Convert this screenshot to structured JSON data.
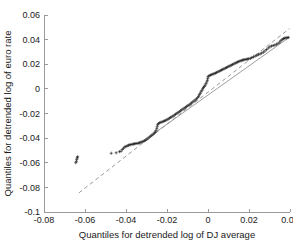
{
  "figure": {
    "name": "qq-plot",
    "background": "#ffffff",
    "axis_color": "#9a9a9a",
    "marker_color": "#111111",
    "reference_line_color": "#8d8d8d"
  },
  "chart_data": {
    "type": "scatter",
    "title": "",
    "subtitle": "",
    "xlabel": "Quantiles for detrended log of DJ average",
    "ylabel": "Quantiles for detrended log of euro rate",
    "xlim": [
      -0.08,
      0.04
    ],
    "ylim": [
      -0.1,
      0.06
    ],
    "xticks": [
      -0.08,
      -0.06,
      -0.04,
      -0.02,
      0,
      0.02,
      0.04
    ],
    "xticklabels": [
      "-0.08",
      "-0.06",
      "-0.04",
      "-0.02",
      "0",
      "0.02",
      "0.04"
    ],
    "yticks": [
      -0.1,
      -0.08,
      -0.06,
      -0.04,
      -0.02,
      0,
      0.02,
      0.04,
      0.06
    ],
    "yticklabels": [
      "-0.1",
      "-0.08",
      "-0.06",
      "-0.04",
      "-0.02",
      "0",
      "0.02",
      "0.04",
      "0.06"
    ],
    "grid": false,
    "legend": null,
    "legend_position": "none",
    "marker": "+",
    "annotations": [],
    "series": [
      {
        "name": "sample quantiles",
        "marker": "+",
        "color": "#111111",
        "points": [
          [
            -0.0645,
            -0.06
          ],
          [
            -0.0642,
            -0.0588
          ],
          [
            -0.064,
            -0.0572
          ],
          [
            -0.0638,
            -0.056
          ],
          [
            -0.0636,
            -0.0551
          ],
          [
            -0.0472,
            -0.0523
          ],
          [
            -0.0448,
            -0.0519
          ],
          [
            -0.0432,
            -0.051
          ],
          [
            -0.0424,
            -0.0506
          ],
          [
            -0.0418,
            -0.0492
          ],
          [
            -0.0412,
            -0.0482
          ],
          [
            -0.0406,
            -0.0472
          ],
          [
            -0.04,
            -0.0468
          ],
          [
            -0.0394,
            -0.0462
          ],
          [
            -0.0388,
            -0.0458
          ],
          [
            -0.0382,
            -0.0455
          ],
          [
            -0.0376,
            -0.0452
          ],
          [
            -0.037,
            -0.045
          ],
          [
            -0.0364,
            -0.0448
          ],
          [
            -0.0358,
            -0.0446
          ],
          [
            -0.0352,
            -0.0444
          ],
          [
            -0.0346,
            -0.0443
          ],
          [
            -0.034,
            -0.0441
          ],
          [
            -0.0334,
            -0.0438
          ],
          [
            -0.0328,
            -0.0434
          ],
          [
            -0.0322,
            -0.043
          ],
          [
            -0.0316,
            -0.0426
          ],
          [
            -0.031,
            -0.0421
          ],
          [
            -0.0304,
            -0.0415
          ],
          [
            -0.0298,
            -0.0408
          ],
          [
            -0.0292,
            -0.04
          ],
          [
            -0.0286,
            -0.0392
          ],
          [
            -0.028,
            -0.0384
          ],
          [
            -0.0274,
            -0.0376
          ],
          [
            -0.0268,
            -0.0368
          ],
          [
            -0.0262,
            -0.036
          ],
          [
            -0.0258,
            -0.0352
          ],
          [
            -0.0254,
            -0.034
          ],
          [
            -0.025,
            -0.0324
          ],
          [
            -0.0248,
            -0.0308
          ],
          [
            -0.0246,
            -0.0292
          ],
          [
            -0.0242,
            -0.0282
          ],
          [
            -0.0236,
            -0.0276
          ],
          [
            -0.023,
            -0.0272
          ],
          [
            -0.0224,
            -0.0268
          ],
          [
            -0.0218,
            -0.0264
          ],
          [
            -0.0212,
            -0.026
          ],
          [
            -0.0206,
            -0.0256
          ],
          [
            -0.02,
            -0.025
          ],
          [
            -0.0194,
            -0.0244
          ],
          [
            -0.0188,
            -0.0238
          ],
          [
            -0.0182,
            -0.0232
          ],
          [
            -0.0176,
            -0.0226
          ],
          [
            -0.017,
            -0.022
          ],
          [
            -0.0164,
            -0.0213
          ],
          [
            -0.0158,
            -0.0206
          ],
          [
            -0.0152,
            -0.0199
          ],
          [
            -0.0146,
            -0.0192
          ],
          [
            -0.014,
            -0.0185
          ],
          [
            -0.0134,
            -0.0178
          ],
          [
            -0.0128,
            -0.0171
          ],
          [
            -0.0122,
            -0.0164
          ],
          [
            -0.0116,
            -0.0157
          ],
          [
            -0.011,
            -0.015
          ],
          [
            -0.0104,
            -0.0143
          ],
          [
            -0.0098,
            -0.0136
          ],
          [
            -0.0092,
            -0.0129
          ],
          [
            -0.0086,
            -0.0122
          ],
          [
            -0.008,
            -0.0114
          ],
          [
            -0.0074,
            -0.0106
          ],
          [
            -0.0068,
            -0.0098
          ],
          [
            -0.0062,
            -0.009
          ],
          [
            -0.0056,
            -0.0081
          ],
          [
            -0.005,
            -0.0071
          ],
          [
            -0.0046,
            -0.006
          ],
          [
            -0.0042,
            -0.0048
          ],
          [
            -0.0038,
            -0.0036
          ],
          [
            -0.0034,
            -0.0024
          ],
          [
            -0.003,
            -0.0012
          ],
          [
            -0.0026,
            0.0
          ],
          [
            -0.0022,
            0.001
          ],
          [
            -0.0018,
            0.002
          ],
          [
            -0.0014,
            0.003
          ],
          [
            -0.001,
            0.0042
          ],
          [
            -0.0006,
            0.0056
          ],
          [
            -0.0003,
            0.007
          ],
          [
            -0.0001,
            0.0086
          ],
          [
            0.0001,
            0.01
          ],
          [
            0.0006,
            0.0108
          ],
          [
            0.0012,
            0.0112
          ],
          [
            0.0018,
            0.0116
          ],
          [
            0.0024,
            0.012
          ],
          [
            0.003,
            0.0124
          ],
          [
            0.0036,
            0.0128
          ],
          [
            0.0042,
            0.0133
          ],
          [
            0.0048,
            0.0138
          ],
          [
            0.0054,
            0.0143
          ],
          [
            0.006,
            0.0148
          ],
          [
            0.0066,
            0.0153
          ],
          [
            0.0072,
            0.0158
          ],
          [
            0.0078,
            0.0163
          ],
          [
            0.0084,
            0.0168
          ],
          [
            0.009,
            0.0173
          ],
          [
            0.0096,
            0.0178
          ],
          [
            0.0102,
            0.0183
          ],
          [
            0.0108,
            0.0188
          ],
          [
            0.0114,
            0.0193
          ],
          [
            0.012,
            0.0198
          ],
          [
            0.0126,
            0.0203
          ],
          [
            0.0132,
            0.0208
          ],
          [
            0.0138,
            0.0213
          ],
          [
            0.0144,
            0.0218
          ],
          [
            0.015,
            0.0222
          ],
          [
            0.0156,
            0.0226
          ],
          [
            0.0162,
            0.023
          ],
          [
            0.0168,
            0.0233
          ],
          [
            0.0174,
            0.0236
          ],
          [
            0.018,
            0.0238
          ],
          [
            0.0186,
            0.024
          ],
          [
            0.0192,
            0.0242
          ],
          [
            0.0198,
            0.0244
          ],
          [
            0.0206,
            0.0248
          ],
          [
            0.0214,
            0.0254
          ],
          [
            0.0222,
            0.026
          ],
          [
            0.023,
            0.0266
          ],
          [
            0.0238,
            0.0272
          ],
          [
            0.0246,
            0.0278
          ],
          [
            0.0254,
            0.0284
          ],
          [
            0.0262,
            0.029
          ],
          [
            0.027,
            0.0298
          ],
          [
            0.0278,
            0.0308
          ],
          [
            0.0286,
            0.032
          ],
          [
            0.0294,
            0.0332
          ],
          [
            0.0302,
            0.0342
          ],
          [
            0.031,
            0.0348
          ],
          [
            0.0318,
            0.0352
          ],
          [
            0.0326,
            0.0356
          ],
          [
            0.0334,
            0.0362
          ],
          [
            0.0342,
            0.037
          ],
          [
            0.035,
            0.038
          ],
          [
            0.0356,
            0.0392
          ],
          [
            0.0362,
            0.0402
          ],
          [
            0.0368,
            0.0408
          ],
          [
            0.0374,
            0.0412
          ],
          [
            0.038,
            0.0414
          ],
          [
            0.0386,
            0.0416
          ],
          [
            0.0392,
            0.0418
          ]
        ]
      }
    ],
    "reference_lines": [
      {
        "name": "quartile-fit-line-solid",
        "style": "solid",
        "color": "#8d8d8d",
        "x": [
          -0.0262,
          0.0396
        ],
        "y": [
          -0.036,
          0.0418
        ]
      },
      {
        "name": "quartile-fit-line-dashed-extension",
        "style": "dashed",
        "color": "#8d8d8d",
        "x": [
          -0.063,
          0.0398
        ],
        "y": [
          -0.0845,
          0.049
        ]
      }
    ]
  }
}
